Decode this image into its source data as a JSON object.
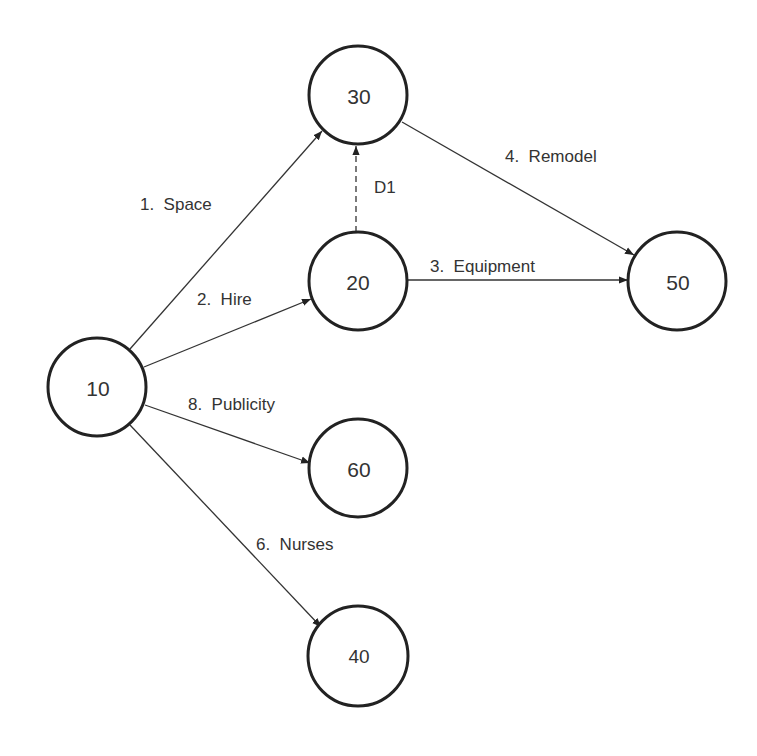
{
  "diagram": {
    "type": "activity-on-arrow network",
    "nodes": [
      {
        "id": "10",
        "label": "10",
        "cx": 97,
        "cy": 387
      },
      {
        "id": "20",
        "label": "20",
        "cx": 358,
        "cy": 281
      },
      {
        "id": "30",
        "label": "30",
        "cx": 358,
        "cy": 95
      },
      {
        "id": "40",
        "label": "40",
        "cx": 358,
        "cy": 656
      },
      {
        "id": "50",
        "label": "50",
        "cx": 677,
        "cy": 281
      },
      {
        "id": "60",
        "label": "60",
        "cx": 358,
        "cy": 468
      }
    ],
    "edges": [
      {
        "id": "1",
        "from": "10",
        "to": "30",
        "label": "1.  Space",
        "dashed": false
      },
      {
        "id": "2",
        "from": "10",
        "to": "20",
        "label": "2.  Hire",
        "dashed": false
      },
      {
        "id": "3",
        "from": "20",
        "to": "50",
        "label": "3.  Equipment",
        "dashed": false
      },
      {
        "id": "4",
        "from": "30",
        "to": "50",
        "label": "4.  Remodel",
        "dashed": false
      },
      {
        "id": "6",
        "from": "10",
        "to": "40",
        "label": "6.  Nurses",
        "dashed": false
      },
      {
        "id": "8",
        "from": "10",
        "to": "60",
        "label": "8.  Publicity",
        "dashed": false
      },
      {
        "id": "D1",
        "from": "20",
        "to": "30",
        "label": "D1",
        "dashed": true
      }
    ]
  },
  "nodes": {
    "n10": "10",
    "n20": "20",
    "n30": "30",
    "n40": "40",
    "n50": "50",
    "n60": "60"
  },
  "edges": {
    "space": "1.  Space",
    "hire": "2.  Hire",
    "equipment": "3.  Equipment",
    "remodel": "4.  Remodel",
    "nurses": "6.  Nurses",
    "publicity": "8.  Publicity",
    "dummy": "D1"
  },
  "colors": {
    "stroke": "#222222",
    "text": "#333333",
    "background": "#ffffff"
  }
}
